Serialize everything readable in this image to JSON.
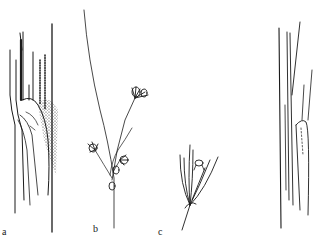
{
  "figure": {
    "panels": [
      {
        "id": "a",
        "label": "a",
        "subject": "leaf-sheath-with-ligule-stippled"
      },
      {
        "id": "b",
        "label": "b",
        "subject": "inflorescence-with-spikelet-clusters"
      },
      {
        "id": "c",
        "label": "c",
        "subject": "spikelet-cluster-detail"
      },
      {
        "id": "d",
        "label": "",
        "subject": "leaf-sheath-with-ligule-outline"
      }
    ],
    "colors": {
      "ink": "#1a1a1a",
      "background": "#ffffff"
    }
  }
}
